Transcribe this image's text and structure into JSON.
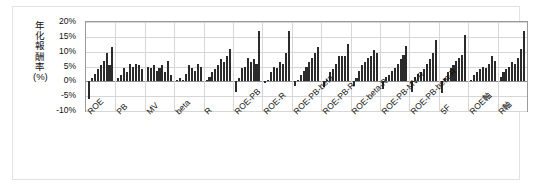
{
  "chart_data": {
    "type": "bar",
    "title": "",
    "subtitle": "",
    "xlabel": "",
    "ylabel": "年化報酬率(%)",
    "ylim": [
      -10,
      20
    ],
    "ytick_labels": [
      "20%",
      "15%",
      "10%",
      "5%",
      "0%",
      "-5%",
      "-10%"
    ],
    "ytick_values": [
      20,
      15,
      10,
      5,
      0,
      -5,
      -10
    ],
    "grid": true,
    "legend": "none",
    "bar_color": "#2b2b2b",
    "note": "Grouped bar chart: 14 factor/strategy groups, each group holds one bar per decile/quantile portfolio; values are annualised returns in percent.",
    "categories": [
      "ROE",
      "PB",
      "MV",
      "beta",
      "R",
      "ROE-PB",
      "ROE-R",
      "ROE-PB-beta",
      "ROE-PB-R",
      "ROE-beta-R",
      "ROE-PB-MV-R",
      "ROE-PB-beta-R",
      "5F",
      "ROE軸",
      "R軸"
    ],
    "groups": [
      {
        "name": "ROE",
        "values": [
          -6.0,
          1.0,
          2.5,
          4.0,
          5.5,
          7.0,
          9.5,
          5.5,
          11.5
        ]
      },
      {
        "name": "PB",
        "values": [
          1.0,
          2.0,
          4.5,
          3.0,
          6.0,
          5.0,
          6.0,
          5.5,
          4.0
        ]
      },
      {
        "name": "MV",
        "values": [
          5.0,
          4.5,
          5.5,
          3.5,
          4.5,
          5.5,
          3.0,
          7.0,
          2.0
        ]
      },
      {
        "name": "beta",
        "values": [
          0.5,
          1.0,
          0.5,
          2.5,
          5.5,
          4.5,
          3.5,
          6.0,
          5.0
        ]
      },
      {
        "name": "R",
        "values": [
          0.5,
          1.5,
          3.0,
          4.0,
          5.5,
          7.5,
          6.5,
          8.5,
          11.0
        ]
      },
      {
        "name": "ROE-PB",
        "values": [
          -3.5,
          1.0,
          4.5,
          5.0,
          8.0,
          6.5,
          7.5,
          6.0,
          17.0
        ]
      },
      {
        "name": "ROE-R",
        "values": [
          -0.5,
          0.5,
          3.0,
          5.0,
          4.5,
          6.5,
          6.0,
          9.5,
          17.0
        ]
      },
      {
        "name": "ROE-PB-beta",
        "values": [
          -1.5,
          0.5,
          2.0,
          3.5,
          5.0,
          6.5,
          8.0,
          9.5,
          11.5
        ]
      },
      {
        "name": "ROE-PB-R",
        "values": [
          -2.0,
          0.5,
          3.0,
          4.0,
          6.0,
          8.5,
          8.5,
          8.5,
          12.5
        ]
      },
      {
        "name": "ROE-beta-R",
        "values": [
          -1.5,
          1.0,
          3.5,
          5.5,
          6.5,
          8.0,
          8.5,
          10.5,
          9.5
        ]
      },
      {
        "name": "ROE-PB-MV-R",
        "values": [
          -2.5,
          1.5,
          2.0,
          3.5,
          4.5,
          6.0,
          7.5,
          9.0,
          12.0
        ]
      },
      {
        "name": "ROE-PB-beta-R",
        "values": [
          -3.5,
          1.5,
          2.5,
          3.0,
          4.0,
          6.0,
          7.5,
          9.5,
          14.0
        ]
      },
      {
        "name": "5F",
        "values": [
          -4.0,
          1.0,
          3.0,
          4.5,
          5.5,
          7.0,
          8.0,
          9.0,
          15.5
        ]
      },
      {
        "name": "ROE軸",
        "values": [
          0.5,
          2.0,
          3.0,
          4.0,
          5.0,
          4.5,
          6.0,
          8.5,
          7.0
        ]
      },
      {
        "name": "R軸",
        "values": [
          1.5,
          3.0,
          4.0,
          5.0,
          6.5,
          6.0,
          8.0,
          11.0,
          17.0
        ]
      }
    ]
  }
}
